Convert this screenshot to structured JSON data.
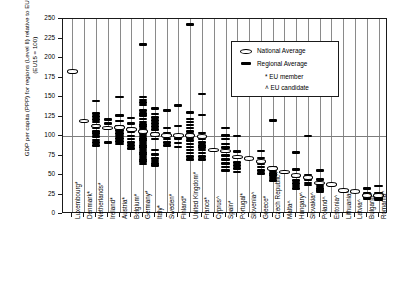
{
  "chart_data": {
    "type": "scatter",
    "title": "",
    "ylabel": "GDP per capita (PPP) for regions (Level II) relative to EU average in 1999 (EU15 = 100)",
    "xlabel": "",
    "ylim": [
      0,
      250
    ],
    "yticks": [
      0,
      25,
      50,
      75,
      100,
      125,
      150,
      175,
      200,
      225,
      250
    ],
    "reference_line": 100,
    "grid": "vertical",
    "legend": {
      "position": "top-right",
      "entries": [
        {
          "marker": "ellipse-open",
          "label": "National Average"
        },
        {
          "marker": "bar-filled",
          "label": "Regional Average"
        },
        {
          "marker": "asterisk",
          "label": "EU member"
        },
        {
          "marker": "caret",
          "label": "EU candidate"
        }
      ]
    },
    "categories": [
      "Luxembourg*",
      "Denmark*",
      "Netherlands*",
      "Ireland*",
      "Austria*",
      "Belgium*",
      "Germany*",
      "Italy*",
      "Sweden*",
      "Finland*",
      "United Kingdom*",
      "France*",
      "Cyprus^",
      "Spain*",
      "Portugal*",
      "Slovenia^",
      "Greece*",
      "Czech Republic^",
      "Malta^",
      "Hungary^",
      "Slovakia^",
      "Poland^",
      "Estonia^",
      "Lithuania^",
      "Latvia^",
      "Bulgaria^",
      "Romania^"
    ],
    "series": [
      {
        "name": "National Average",
        "values": [
          183,
          119,
          113,
          110,
          111,
          108,
          106,
          102,
          101,
          101,
          101,
          99,
          82,
          81,
          73,
          71,
          67,
          58,
          54,
          49,
          47,
          40,
          38,
          30,
          29,
          24,
          24
        ]
      },
      {
        "name": "Regional Average",
        "points": {
          "Luxembourg*": [
            183
          ],
          "Denmark*": [
            119
          ],
          "Netherlands*": [
            145,
            129,
            125,
            121,
            118,
            114,
            110,
            106,
            103,
            99,
            95,
            92,
            88
          ],
          "Ireland*": [
            121,
            116,
            92
          ],
          "Austria*": [
            150,
            126,
            119,
            112,
            107,
            103,
            100,
            97,
            93,
            90
          ],
          "Belgium*": [
            123,
            116,
            110,
            105,
            100,
            96,
            92,
            88,
            84
          ],
          "Germany*": [
            217,
            150,
            146,
            143,
            140,
            133,
            129,
            126,
            122,
            118,
            115,
            112,
            109,
            106,
            103,
            100,
            97,
            94,
            91,
            88,
            85,
            82,
            79,
            76,
            73,
            70,
            67,
            64
          ],
          "Italy*": [
            135,
            128,
            124,
            120,
            116,
            112,
            108,
            104,
            100,
            96,
            82,
            76,
            71,
            68,
            65,
            62
          ],
          "Sweden*": [
            133,
            110,
            104,
            100,
            96,
            92,
            88
          ],
          "Finland*": [
            139,
            113,
            101,
            97,
            91,
            86
          ],
          "United Kingdom*": [
            243,
            130,
            122,
            118,
            114,
            110,
            106,
            102,
            98,
            94,
            90,
            86,
            82,
            78,
            74,
            70
          ],
          "France*": [
            154,
            127,
            104,
            96,
            92,
            88,
            85,
            82,
            78,
            74,
            70
          ],
          "Cyprus^": [
            82
          ],
          "Spain*": [
            110,
            101,
            96,
            90,
            85,
            80,
            75,
            70,
            65,
            60,
            56
          ],
          "Portugal*": [
            100,
            80,
            72,
            66,
            62,
            58,
            54
          ],
          "Slovenia^": [
            71
          ],
          "Greece*": [
            81,
            72,
            68,
            64,
            60,
            56,
            52
          ],
          "Czech Republic^": [
            120,
            60,
            55,
            52,
            49,
            46,
            43
          ],
          "Malta^": [
            54
          ],
          "Hungary^": [
            79,
            57,
            48,
            43,
            39,
            36,
            33
          ],
          "Slovakia^": [
            100,
            50,
            44,
            40,
            37
          ],
          "Poland^": [
            56,
            44,
            39,
            36,
            33,
            30,
            28
          ],
          "Estonia^": [
            38
          ],
          "Lithuania^": [
            30
          ],
          "Latvia^": [
            29
          ],
          "Bulgaria^": [
            33,
            26,
            23,
            21,
            19
          ],
          "Romania^": [
            36,
            27,
            24,
            22,
            20,
            18
          ]
        }
      }
    ],
    "footnotes": [
      "* EU member",
      "^ EU candidate"
    ]
  }
}
